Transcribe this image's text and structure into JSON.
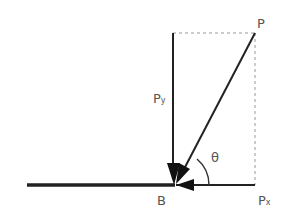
{
  "diagram": {
    "type": "force-vector-decomposition",
    "labels": {
      "point_p": "P",
      "component_y": "P",
      "component_y_sub": "y",
      "component_x": "P",
      "component_x_sub": "x",
      "origin": "B",
      "angle": "θ"
    },
    "colors": {
      "line": "#222222",
      "dashed": "#999999",
      "text": "#555555"
    }
  }
}
